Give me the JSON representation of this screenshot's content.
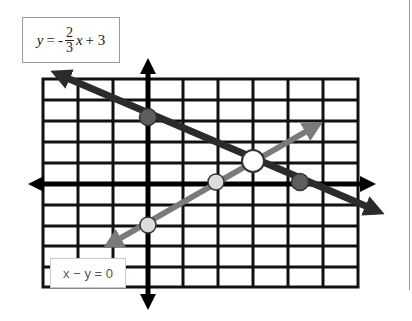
{
  "labels": {
    "equation1": {
      "lhs": "y",
      "eq": "=",
      "sign": "-",
      "numerator": "2",
      "denominator": "3",
      "var": "x",
      "rest": "+ 3",
      "full": "y = -2/3 x + 3"
    },
    "equation2": "x − y = 0"
  },
  "grid": {
    "x_min": -3,
    "x_max": 6,
    "y_min": -5,
    "y_max": 5,
    "columns": 9,
    "rows": 10,
    "origin_px": [
      148,
      184
    ],
    "color": "#111111"
  },
  "colors": {
    "line1": "#2b2b2b",
    "line2": "#7a7a7a",
    "point_dark": "#5e5e5e",
    "point_light": "#dcdcdc",
    "point_intersection": "#ffffff",
    "axis": "#000000"
  },
  "lines": [
    {
      "name": "y = -2/3 x + 3",
      "slope": -0.6667,
      "intercept": 3,
      "color_key": "line1"
    },
    {
      "name": "x - y = 0",
      "slope": 1,
      "intercept": 0,
      "color_key": "line2"
    }
  ],
  "points": [
    {
      "name": "y-intercept of line 1",
      "x": 0,
      "y": 3,
      "style": "dark"
    },
    {
      "name": "x-intercept of line 1",
      "x": 4.5,
      "y": 0,
      "style": "dark"
    },
    {
      "name": "origin point on line 2",
      "x": 2,
      "y": 0,
      "style": "light"
    },
    {
      "name": "y-intercept of line 2",
      "x": 0,
      "y": -2,
      "style": "light"
    },
    {
      "name": "intersection",
      "x": 3,
      "y": 1,
      "style": "white"
    }
  ]
}
